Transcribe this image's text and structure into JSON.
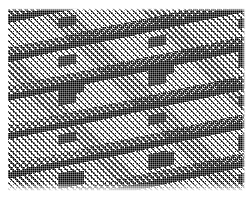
{
  "image": {
    "title": "Woven twill fabric swatch",
    "caption": "Bilevel (1-bit) dithered scan of a woven textile showing diagonal twill lines crossed by heavy weft bands",
    "width_px": 246,
    "height_px": 197,
    "color_mode": "bilevel black and white halftone",
    "ink_color": "#000000",
    "ground_color": "#ffffff"
  },
  "margins": {
    "top_px": 8,
    "left_px": 8,
    "right_px": 2,
    "bottom_px": 12
  },
  "pattern": {
    "name": "twill-weave",
    "twill_angle_deg": 45,
    "twill_line_period_px": 4.2,
    "twill_line_width_px": 1.6,
    "warp_rib_spacing_px": 12,
    "weft_band_angle_deg": -12,
    "weft_band_thickness_px": 11,
    "weft_band_spacing_px": 38,
    "block_cluster_period_px": 90,
    "block_cell_px": 3,
    "dither_cell_px": 2
  },
  "layers": [
    {
      "id": "twill-main",
      "label": "Diagonal twill lines"
    },
    {
      "id": "weave-warp",
      "label": "Warp and weft crossing threads"
    },
    {
      "id": "ribs",
      "label": "Vertical rib columns"
    },
    {
      "id": "bands",
      "label": "Heavy weft bands with crenellated edges"
    },
    {
      "id": "bands-core",
      "label": "Solid weft band cores"
    },
    {
      "id": "blocks",
      "label": "Dark block clusters"
    },
    {
      "id": "blocks-alt",
      "label": "Offset dark block clusters"
    },
    {
      "id": "pixelate",
      "label": "One bit dither quantisation grid"
    }
  ]
}
